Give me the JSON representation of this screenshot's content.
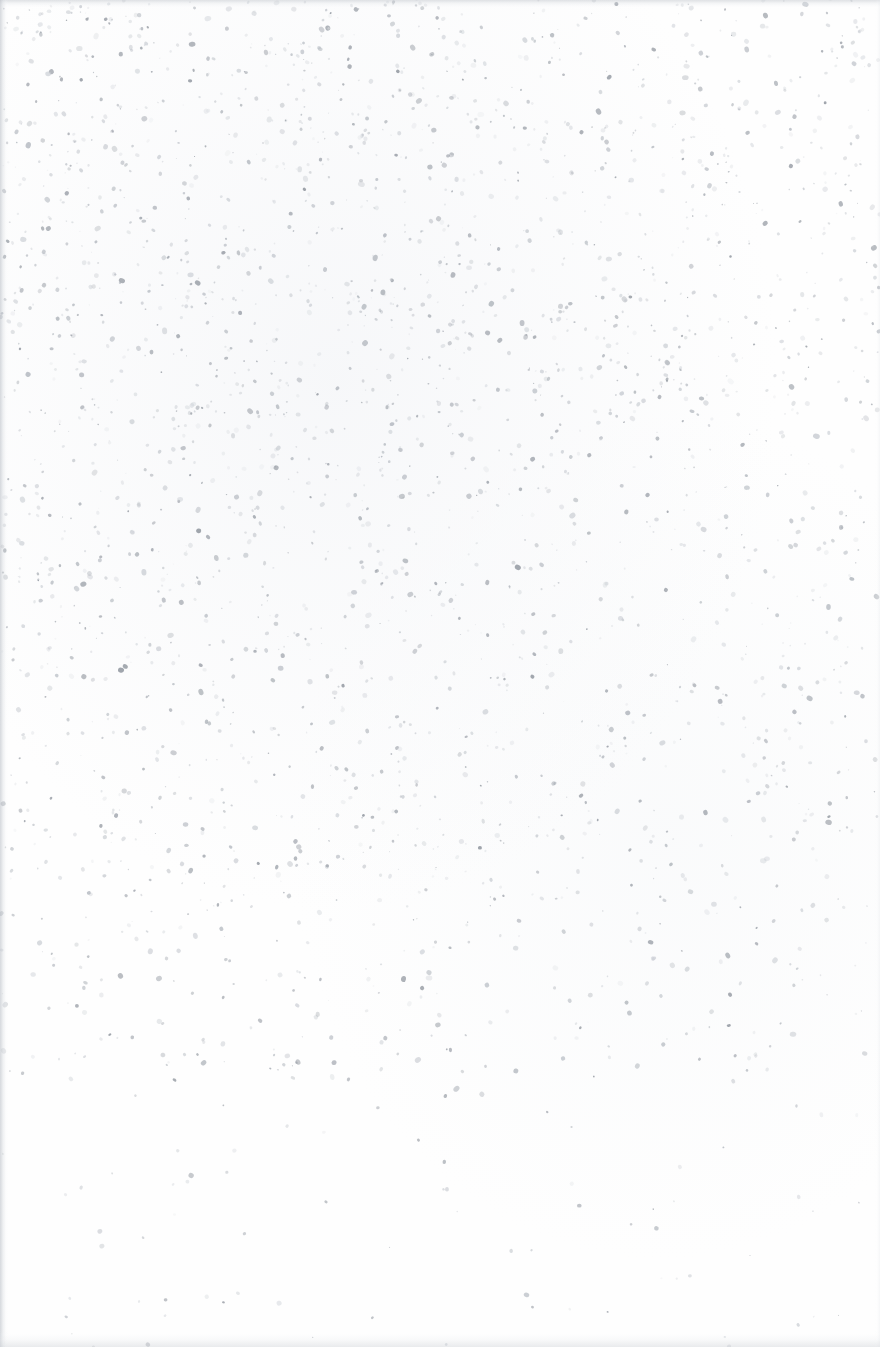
{
  "page": {
    "kind": "scanned-blank-page",
    "width": 880,
    "height": 1347,
    "orientation": "portrait",
    "visible_text": "",
    "accessible_description": "Blank scanned document page with scanner speckle noise and faint edge shadows; no printed text or graphics.",
    "paper_color": "#fefefe",
    "base_tint": "#f8f9fa"
  },
  "noise": {
    "seed": 20240517,
    "total_specks": 2600,
    "speck_colors": [
      "#c9cdd3",
      "#b6bbc2",
      "#a4aab2",
      "#8e949d",
      "#7b828c",
      "#dadde1"
    ],
    "size_min_px": 0.5,
    "size_max_px": 2.6,
    "opacity_min": 0.18,
    "opacity_max": 0.72,
    "density_bands": [
      {
        "name": "top-band",
        "y_start": 0,
        "y_end": 120,
        "weight": 0.85
      },
      {
        "name": "upper-dense-band",
        "y_start": 120,
        "y_end": 520,
        "weight": 1.0
      },
      {
        "name": "middle-band",
        "y_start": 520,
        "y_end": 880,
        "weight": 0.78
      },
      {
        "name": "lower-band",
        "y_start": 880,
        "y_end": 1080,
        "weight": 0.46
      },
      {
        "name": "bottom-sparse",
        "y_start": 1080,
        "y_end": 1347,
        "weight": 0.1
      }
    ],
    "horizontal_falloff": {
      "note": "speckle slightly denser on the left/upper-left of the sheet",
      "left_weight": 1.0,
      "right_weight": 0.82
    },
    "cluster_count": 46,
    "cluster_radius_px": 26,
    "cluster_speck_count": 7
  },
  "edges": {
    "top": {
      "label": "top-scan-edge-shadow",
      "height_px": 9,
      "color": "#c6cad0"
    },
    "left": {
      "label": "left-scan-edge-shadow",
      "width_px": 8,
      "color": "#babfc6"
    },
    "bottom": {
      "label": "bottom-scan-edge-smudge",
      "height_px": 16,
      "color": "#ced2d7"
    },
    "right": {
      "label": "right-scan-edge-falloff",
      "width_px": 5,
      "color": "#e4e7eb"
    }
  }
}
